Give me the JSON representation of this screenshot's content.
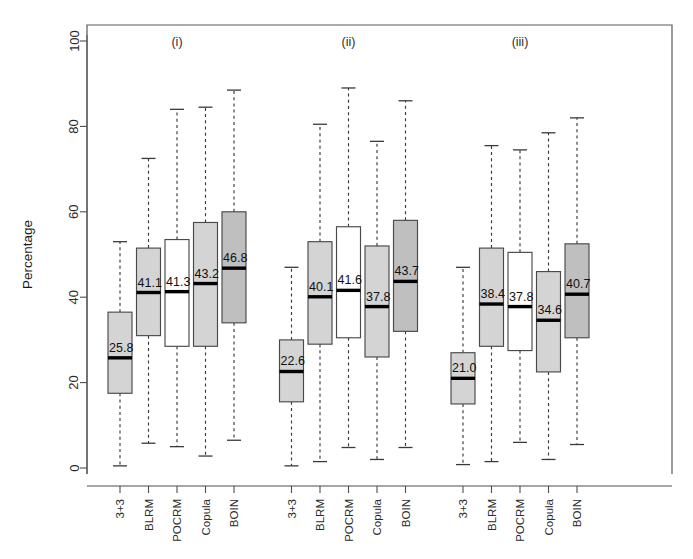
{
  "chart_data": {
    "type": "box",
    "title": "",
    "xlabel": "",
    "ylabel": "Percentage",
    "ylim": [
      0,
      100
    ],
    "yticks": [
      0,
      20,
      40,
      60,
      80,
      100
    ],
    "grid": false,
    "legend": "none",
    "panels": [
      {
        "title": "(i)",
        "categories": [
          "3+3",
          "BLRM",
          "POCRM",
          "Copula",
          "BOIN"
        ],
        "boxes": [
          {
            "label": "3+3",
            "median": 25.8,
            "median_text": "25.8",
            "q1": 17.5,
            "q3": 36.5,
            "whisker_low": 0.5,
            "whisker_high": 53.0,
            "fill": "#d4d4d4"
          },
          {
            "label": "BLRM",
            "median": 41.1,
            "median_text": "41.1",
            "q1": 31.0,
            "q3": 51.5,
            "whisker_low": 5.8,
            "whisker_high": 72.5,
            "fill": "#d4d4d4"
          },
          {
            "label": "POCRM",
            "median": 41.3,
            "median_text": "41.3",
            "q1": 28.5,
            "q3": 53.5,
            "whisker_low": 5.0,
            "whisker_high": 84.0,
            "fill": "#ffffff"
          },
          {
            "label": "Copula",
            "median": 43.2,
            "median_text": "43.2",
            "q1": 28.5,
            "q3": 57.5,
            "whisker_low": 2.8,
            "whisker_high": 84.5,
            "fill": "#d4d4d4"
          },
          {
            "label": "BOIN",
            "median": 46.8,
            "median_text": "46.8",
            "q1": 34.0,
            "q3": 60.0,
            "whisker_low": 6.5,
            "whisker_high": 88.5,
            "fill": "#bfbfbf"
          }
        ]
      },
      {
        "title": "(ii)",
        "categories": [
          "3+3",
          "BLRM",
          "POCRM",
          "Copula",
          "BOIN"
        ],
        "boxes": [
          {
            "label": "3+3",
            "median": 22.6,
            "median_text": "22.6",
            "q1": 15.5,
            "q3": 30.0,
            "whisker_low": 0.5,
            "whisker_high": 47.0,
            "fill": "#d4d4d4"
          },
          {
            "label": "BLRM",
            "median": 40.1,
            "median_text": "40.1",
            "q1": 29.0,
            "q3": 53.0,
            "whisker_low": 1.5,
            "whisker_high": 80.5,
            "fill": "#d4d4d4"
          },
          {
            "label": "POCRM",
            "median": 41.6,
            "median_text": "41.6",
            "q1": 30.5,
            "q3": 56.5,
            "whisker_low": 4.8,
            "whisker_high": 89.0,
            "fill": "#ffffff"
          },
          {
            "label": "Copula",
            "median": 37.8,
            "median_text": "37.8",
            "q1": 26.0,
            "q3": 52.0,
            "whisker_low": 2.0,
            "whisker_high": 76.5,
            "fill": "#d4d4d4"
          },
          {
            "label": "BOIN",
            "median": 43.7,
            "median_text": "43.7",
            "q1": 32.0,
            "q3": 58.0,
            "whisker_low": 4.8,
            "whisker_high": 86.0,
            "fill": "#bfbfbf"
          }
        ]
      },
      {
        "title": "(iii)",
        "categories": [
          "3+3",
          "BLRM",
          "POCRM",
          "Copula",
          "BOIN"
        ],
        "boxes": [
          {
            "label": "3+3",
            "median": 21.0,
            "median_text": "21.0",
            "q1": 15.0,
            "q3": 27.0,
            "whisker_low": 0.8,
            "whisker_high": 47.0,
            "fill": "#d4d4d4"
          },
          {
            "label": "BLRM",
            "median": 38.4,
            "median_text": "38.4",
            "q1": 28.5,
            "q3": 51.5,
            "whisker_low": 1.5,
            "whisker_high": 75.5,
            "fill": "#d4d4d4"
          },
          {
            "label": "POCRM",
            "median": 37.8,
            "median_text": "37.8",
            "q1": 27.5,
            "q3": 50.5,
            "whisker_low": 6.0,
            "whisker_high": 74.5,
            "fill": "#ffffff"
          },
          {
            "label": "Copula",
            "median": 34.6,
            "median_text": "34.6",
            "q1": 22.5,
            "q3": 46.0,
            "whisker_low": 2.0,
            "whisker_high": 78.5,
            "fill": "#d4d4d4"
          },
          {
            "label": "BOIN",
            "median": 40.7,
            "median_text": "40.7",
            "q1": 30.5,
            "q3": 52.5,
            "whisker_low": 5.5,
            "whisker_high": 82.0,
            "fill": "#bfbfbf"
          }
        ]
      }
    ],
    "colors": {
      "box_fill_gray": "#d4d4d4",
      "box_fill_white": "#ffffff",
      "box_fill_dark": "#bfbfbf",
      "box_border": "#4a4a4a",
      "median_line": "#000000",
      "whisker": "#3a3a3a",
      "axis": "#4d4d4d",
      "background": "#ffffff"
    }
  }
}
